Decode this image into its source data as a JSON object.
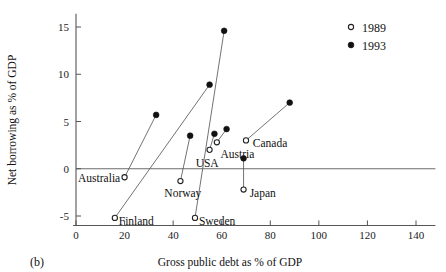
{
  "panel": {
    "caption": "(b)"
  },
  "chart_data": {
    "type": "scatter",
    "title": "",
    "xlabel": "Gross public debt as % of GDP",
    "ylabel": "Net borrowing as % of GDP",
    "xlim": [
      0,
      148
    ],
    "ylim": [
      -6.2,
      16.5
    ],
    "xticks": [
      0,
      20,
      40,
      60,
      80,
      100,
      120,
      140
    ],
    "xtick_labels": [
      "0",
      "20",
      "40",
      "60",
      "80",
      "100",
      "120",
      "140"
    ],
    "yticks": [
      -5,
      0,
      5,
      10,
      15
    ],
    "ytick_labels": [
      "-5",
      "0",
      "5",
      "10",
      "15"
    ],
    "grid": false,
    "zero_line": true,
    "legend_position": "top-right",
    "series": [
      {
        "name": "1989",
        "marker": "open-circle",
        "color": "#ffffff",
        "edge_color": "#222222"
      },
      {
        "name": "1993",
        "marker": "filled-circle",
        "color": "#111111",
        "edge_color": "#111111"
      }
    ],
    "points": [
      {
        "country": "Australia",
        "label_anchor": "end",
        "label_x": 18.2,
        "label_y": -1.0,
        "x_1989": 20.0,
        "y_1989": -0.9,
        "x_1993": 33.0,
        "y_1993": 5.7
      },
      {
        "country": "Finland",
        "label_anchor": "start",
        "label_x": 17.6,
        "label_y": -5.5,
        "x_1989": 16.0,
        "y_1989": -5.2,
        "x_1993": 55.0,
        "y_1993": 8.9
      },
      {
        "country": "Norway",
        "label_anchor": "middle",
        "label_x": 44.0,
        "label_y": -2.6,
        "x_1989": 43.0,
        "y_1989": -1.3,
        "x_1993": 47.0,
        "y_1993": 3.5
      },
      {
        "country": "Sweden",
        "label_anchor": "start",
        "label_x": 50.6,
        "label_y": -5.5,
        "x_1989": 49.0,
        "y_1989": -5.2,
        "x_1993": 61.0,
        "y_1993": 14.6
      },
      {
        "country": "USA",
        "label_anchor": "middle",
        "label_x": 54.0,
        "label_y": 0.6,
        "x_1989": 55.0,
        "y_1989": 2.0,
        "x_1993": 57.0,
        "y_1993": 3.7
      },
      {
        "country": "Austria",
        "label_anchor": "start",
        "label_x": 59.5,
        "label_y": 1.6,
        "x_1989": 58.0,
        "y_1989": 2.8,
        "x_1993": 62.0,
        "y_1993": 4.2
      },
      {
        "country": "Japan",
        "label_anchor": "start",
        "label_x": 71.5,
        "label_y": -2.6,
        "x_1989": 69.0,
        "y_1989": -2.2,
        "x_1993": 69.0,
        "y_1993": 1.1
      },
      {
        "country": "Canada",
        "label_anchor": "start",
        "label_x": 72.8,
        "label_y": 2.7,
        "x_1989": 70.0,
        "y_1989": 3.0,
        "x_1993": 88.0,
        "y_1993": 7.0
      }
    ]
  },
  "legend": {
    "entries": [
      {
        "label": "1989",
        "marker": "open-circle"
      },
      {
        "label": "1993",
        "marker": "filled-circle"
      }
    ]
  }
}
